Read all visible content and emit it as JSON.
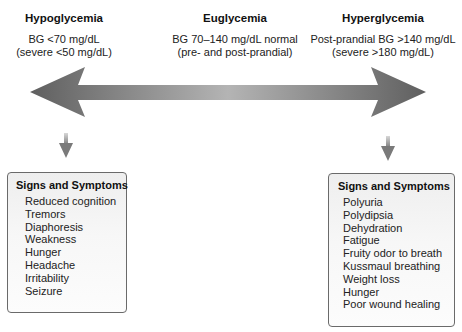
{
  "columns": {
    "hypo": {
      "title": "Hypoglycemia",
      "line1": "BG <70 mg/dL",
      "line2": "(severe <50 mg/dL)"
    },
    "eu": {
      "title": "Euglycemia",
      "line1": "BG 70–140 mg/dL normal",
      "line2": "(pre- and post-prandial)"
    },
    "hyper": {
      "title": "Hyperglycemia",
      "line1": "Post-prandial BG >140 mg/dL",
      "line2": "(severe >180 mg/dL)"
    }
  },
  "arrow": {
    "icon": "double-headed-arrow-icon",
    "color_dark": "#5f5f5f",
    "color_light": "#b4b4b4"
  },
  "boxes": {
    "hypo": {
      "title": "Signs and Symptoms",
      "items": [
        "Reduced cognition",
        "Tremors",
        "Diaphoresis",
        "Weakness",
        "Hunger",
        "Headache",
        "Irritability",
        "Seizure"
      ]
    },
    "hyper": {
      "title": "Signs and Symptoms",
      "items": [
        "Polyuria",
        "Polydipsia",
        "Dehydration",
        "Fatigue",
        "Fruity odor to breath",
        "Kussmaul breathing",
        "Weight loss",
        "Hunger",
        "Poor wound healing"
      ]
    }
  }
}
